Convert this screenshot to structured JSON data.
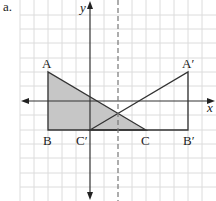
{
  "figure": {
    "part_label": "a.",
    "axes": {
      "x_label": "x",
      "y_label": "y"
    },
    "grid": {
      "unit_px": 14.3,
      "color": "#d9d9d9"
    },
    "mirror_line": {
      "type": "dashed",
      "equation": "x = 2",
      "color": "#777777"
    },
    "original_triangle": {
      "name": "ABC",
      "fill": "#c8c8c8",
      "vertices": [
        {
          "label": "A",
          "x": -3,
          "y": 2
        },
        {
          "label": "B",
          "x": -3,
          "y": -2
        },
        {
          "label": "C",
          "x": 4,
          "y": -2
        }
      ]
    },
    "image_triangle": {
      "name": "A'B'C'",
      "fill": "none",
      "vertices": [
        {
          "label": "A′",
          "x": 7,
          "y": 2
        },
        {
          "label": "B′",
          "x": 7,
          "y": -2
        },
        {
          "label": "C′",
          "x": 0,
          "y": -2
        }
      ]
    },
    "labels": {
      "A": "A",
      "B": "B",
      "C": "C",
      "A_prime": "A′",
      "B_prime": "B′",
      "C_prime": "C′"
    }
  }
}
